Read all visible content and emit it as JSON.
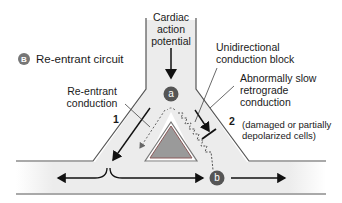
{
  "figure": {
    "panel_letter": "B",
    "panel_title": "Re-entrant circuit"
  },
  "labels": {
    "cardiac_ap": [
      "Cardiac",
      "action",
      "potential"
    ],
    "reentrant_conduction": [
      "Re-entrant",
      "conduction"
    ],
    "unidirectional_block": [
      "Unidirectional",
      "conduction block"
    ],
    "slow_retrograde": [
      "Abnormally slow",
      "retrograde",
      "conduction"
    ],
    "damaged_cells": [
      "(damaged or partially",
      "depolarized cells)"
    ]
  },
  "markers": {
    "a": "a",
    "b": "b",
    "branch1": "1",
    "branch2": "2"
  },
  "colors": {
    "fiber_fill": "#eeeeee",
    "fiber_outline": "#555555",
    "triangle_fill": "#9a9a9a",
    "triangle_outline": "#8a5a5a",
    "badge": "#555555",
    "arrow": "#111111"
  }
}
